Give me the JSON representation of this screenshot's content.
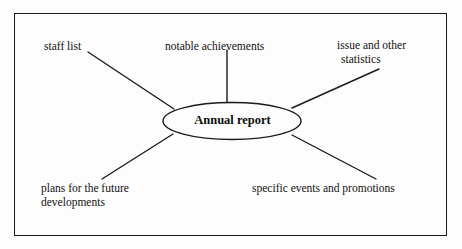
{
  "diagram": {
    "type": "mind-map",
    "title": "Annual report",
    "center": {
      "label": "Annual report",
      "shape": "ellipse",
      "cx": 232,
      "cy": 121,
      "rx": 69,
      "ry": 18.5
    },
    "frame": {
      "border_color": "#1a1a1a",
      "background": "#fdfdfd"
    },
    "line_color": "#1a1a1a",
    "branches": [
      {
        "id": "staff-list",
        "label": "staff list",
        "lines": [
          "staff list"
        ],
        "position": "top-left",
        "connector": {
          "x1": 88,
          "y1": 52,
          "x2": 174,
          "y2": 109
        }
      },
      {
        "id": "notable-achievements",
        "label": "notable achievements",
        "lines": [
          "notable achievements"
        ],
        "position": "top-center",
        "connector": {
          "x1": 227,
          "y1": 50,
          "x2": 227,
          "y2": 103
        }
      },
      {
        "id": "issue-and-other-statistics",
        "label": "issue and other statistics",
        "lines": [
          "issue and other",
          "statistics"
        ],
        "position": "top-right",
        "connector": {
          "x1": 379,
          "y1": 69,
          "x2": 292,
          "y2": 108
        }
      },
      {
        "id": "plans-for-the-future-developments",
        "label": "plans for the future developments",
        "lines": [
          "plans for the future",
          "developments"
        ],
        "position": "bottom-left",
        "connector": {
          "x1": 102,
          "y1": 179,
          "x2": 173,
          "y2": 134
        }
      },
      {
        "id": "specific-events-and-promotions",
        "label": "specific events and promotions",
        "lines": [
          "specific events and promotions"
        ],
        "position": "bottom-right",
        "connector": {
          "x1": 376,
          "y1": 179,
          "x2": 292,
          "y2": 135
        }
      }
    ]
  }
}
